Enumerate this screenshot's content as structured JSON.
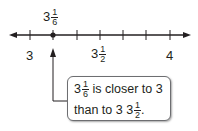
{
  "number_line": {
    "min": 3,
    "max": 4,
    "tick_step": "1/6",
    "ticks": [
      "3",
      "3 1/6",
      "3 2/6",
      "3 1/2",
      "3 4/6",
      "3 5/6",
      "4"
    ],
    "labels": {
      "start": "3",
      "middle_whole": "3",
      "middle_num": "1",
      "middle_den": "2",
      "end": "4"
    },
    "point": {
      "whole": "3",
      "num": "1",
      "den": "6"
    }
  },
  "callout": {
    "line1_whole": "3",
    "line1_num": "1",
    "line1_den": "6",
    "line1_text": "is closer to 3",
    "line2_text": "than to 3",
    "line2_num": "1",
    "line2_den": "2",
    "line2_end": "."
  }
}
